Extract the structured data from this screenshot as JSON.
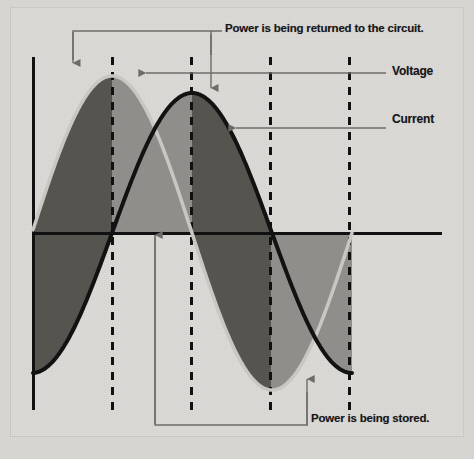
{
  "figure": {
    "background_color": "#d9d7d3"
  },
  "annotations": {
    "power_returned": "Power is being returned to the circuit.",
    "power_stored": "Power is being stored.",
    "voltage": "Voltage",
    "current": "Current"
  },
  "colors": {
    "voltage_curve": "#c9c7c2",
    "current_curve": "#121212",
    "area_voltage": "#8f8e8b",
    "area_overlap": "#55544f",
    "axis": "#111111",
    "dashed_line": "#111111",
    "leader_line": "#6d6c68",
    "text": "#16161a"
  },
  "chart_data": {
    "type": "line",
    "title": "",
    "xlabel": "",
    "ylabel": "",
    "grid": false,
    "legend_position": "right",
    "axis": {
      "zero_line_y_px": 233,
      "y_axis_x_px": 33,
      "x_axis_from_px": 33,
      "x_axis_to_px": 442,
      "y_axis_top_px": 57,
      "y_axis_bottom_px": 410
    },
    "period_px": 320,
    "phase_shift_degrees": 90,
    "dashed_markers_px": [
      113,
      192,
      271,
      350
    ],
    "series": [
      {
        "name": "Voltage",
        "amplitude_px": 157,
        "peak_x_px": 112,
        "zero_crossing_x_px": [
          192,
          352
        ],
        "color": "#c9c7c2",
        "values": [
          0.78,
          0.95,
          1.0,
          0.92,
          0.72,
          0.43,
          0.1,
          -0.24,
          -0.55,
          -0.79,
          -0.95,
          -1.0,
          -0.92,
          -0.72,
          -0.43,
          -0.1,
          0.24
        ]
      },
      {
        "name": "Current",
        "amplitude_px": 140,
        "peak_x_px": 192,
        "zero_crossing_x_px": [
          112,
          271
        ],
        "color": "#121212",
        "values": [
          -0.62,
          -0.31,
          0.0,
          0.38,
          0.69,
          0.9,
          1.0,
          0.97,
          0.83,
          0.61,
          0.31,
          0.0,
          -0.38,
          -0.69,
          -0.9,
          -1.0,
          -0.97
        ]
      }
    ],
    "regions": [
      {
        "name": "power-stored",
        "shading": "#8f8e8b",
        "label": "Power is being stored."
      },
      {
        "name": "power-returned",
        "shading": "#55544f",
        "label": "Power is being returned to the circuit."
      }
    ]
  }
}
